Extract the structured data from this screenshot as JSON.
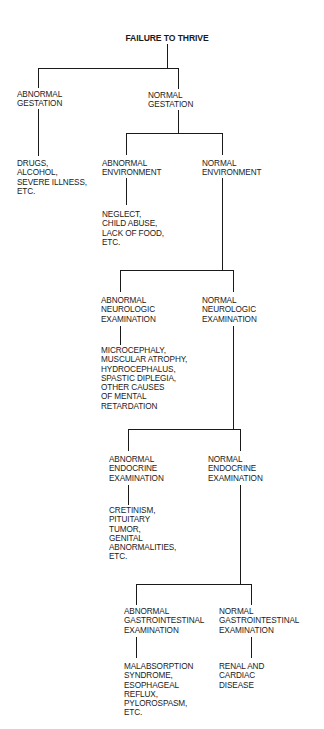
{
  "diagram": {
    "title": "FAILURE TO THRIVE",
    "nodes": {
      "abnormal_gestation": "ABNORMAL\nGESTATION",
      "normal_gestation": "NORMAL\nGESTATION",
      "gestation_causes": "DRUGS,\nALCOHOL,\nSEVERE ILLNESS,\nETC.",
      "abnormal_environment": "ABNORMAL\nENVIRONMENT",
      "normal_environment": "NORMAL\nENVIRONMENT",
      "environment_causes": "NEGLECT,\nCHILD ABUSE,\nLACK OF FOOD,\nETC.",
      "abnormal_neurologic": "ABNORMAL\nNEUROLOGIC\nEXAMINATION",
      "normal_neurologic": "NORMAL\nNEUROLOGIC\nEXAMINATION",
      "neurologic_causes": "MICROCEPHALY,\nMUSCULAR ATROPHY,\nHYDROCEPHALUS,\nSPASTIC DIPLEGIA,\nOTHER CAUSES\nOF MENTAL\nRETARDATION",
      "abnormal_endocrine": "ABNORMAL\nENDOCRINE\nEXAMINATION",
      "normal_endocrine": "NORMAL\nENDOCRINE\nEXAMINATION",
      "endocrine_causes": "CRETINISM,\nPITUITARY\nTUMOR,\nGENITAL\nABNORMALITIES,\nETC.",
      "abnormal_gastrointestinal": "ABNORMAL\nGASTROINTESTINAL\nEXAMINATION",
      "normal_gastrointestinal": "NORMAL\nGASTROINTESTINAL\nEXAMINATION",
      "gastrointestinal_causes": "MALABSORPTION\nSYNDROME,\nESOPHAGEAL\nREFLUX,\nPYLOROSPASM,\nETC.",
      "final_causes": "RENAL AND\nCARDIAC\nDISEASE"
    }
  }
}
